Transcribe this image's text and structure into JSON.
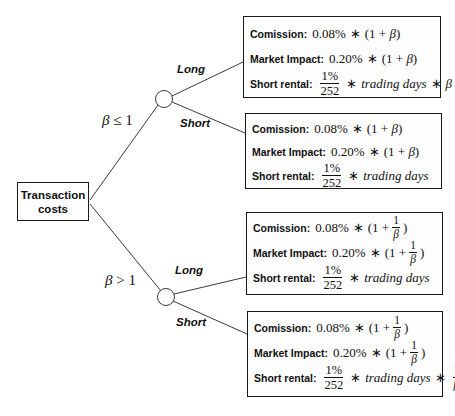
{
  "root": {
    "label_line1": "Transaction",
    "label_line2": "costs"
  },
  "conditions": {
    "upper": {
      "symbol": "β",
      "op": "≤",
      "value": "1"
    },
    "lower": {
      "symbol": "β",
      "op": ">",
      "value": "1"
    }
  },
  "branches": {
    "upper_long": "Long",
    "upper_short": "Short",
    "lower_long": "Long",
    "lower_short": "Short"
  },
  "boxes": [
    {
      "commission_label": "Comission:",
      "commission_rate": "0.08%",
      "market_label": "Market Impact:",
      "market_rate": "0.20%",
      "beta": "β",
      "short_label": "Short rental:",
      "short_num": "1%",
      "short_den": "252",
      "trading_days": "trading days",
      "op": "∗"
    },
    {
      "commission_label": "Comission:",
      "commission_rate": "0.08%",
      "market_label": "Market Impact:",
      "market_rate": "0.20%",
      "beta": "β",
      "short_label": "Short rental:",
      "short_num": "1%",
      "short_den": "252",
      "trading_days": "trading days",
      "op": "∗"
    },
    {
      "commission_label": "Comission:",
      "commission_rate": "0.08%",
      "market_label": "Market Impact:",
      "market_rate": "0.20%",
      "beta": "β",
      "one": "1",
      "short_label": "Short rental:",
      "short_num": "1%",
      "short_den": "252",
      "trading_days": "trading days",
      "op": "∗"
    },
    {
      "commission_label": "Comission:",
      "commission_rate": "0.08%",
      "market_label": "Market Impact:",
      "market_rate": "0.20%",
      "beta": "β",
      "one": "1",
      "short_label": "Short rental:",
      "short_num": "1%",
      "short_den": "252",
      "trading_days": "trading days",
      "op": "∗"
    }
  ],
  "colors": {
    "line": "#3a3a3a",
    "border": "#1a1a1a",
    "text": "#111111",
    "background": "#ffffff"
  }
}
